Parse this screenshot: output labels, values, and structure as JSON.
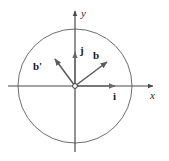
{
  "figure": {
    "name": "unit-circle-basis-vectors",
    "background_color": "#ffffff",
    "stroke_color": "#595959",
    "axis_color": "#4a4a4a",
    "label_color": "#1a1a1a",
    "circle": {
      "center_x": 75,
      "center_y": 86,
      "radius": 57,
      "stroke_color": "#6e6e6e"
    },
    "origin": {
      "x": 75,
      "y": 86,
      "marker": "open-circle"
    },
    "axes": {
      "x": {
        "label": "x",
        "start_x": 8,
        "end_x": 155,
        "y": 86,
        "arrow": "right"
      },
      "y": {
        "label": "y",
        "x": 75,
        "start_y": 152,
        "end_y": 9,
        "arrow": "up"
      }
    },
    "vectors": [
      {
        "label": "i",
        "name": "vector-i",
        "from_x": 75,
        "from_y": 86,
        "to_x": 118,
        "to_y": 86,
        "label_x": 113,
        "label_y": 100,
        "color": "#6b6b6b"
      },
      {
        "label": "j",
        "name": "vector-j",
        "from_x": 75,
        "from_y": 86,
        "to_x": 75,
        "to_y": 49,
        "label_x": 80,
        "label_y": 53,
        "color": "#6b6b6b"
      },
      {
        "label": "b",
        "name": "vector-b",
        "from_x": 75,
        "from_y": 86,
        "to_x": 110,
        "to_y": 60,
        "label_x": 95,
        "label_y": 58,
        "color": "#5a5a5a"
      },
      {
        "label": "b'",
        "name": "vector-b-prime",
        "from_x": 75,
        "from_y": 86,
        "to_x": 53,
        "to_y": 56,
        "label_x": 36,
        "label_y": 69,
        "color": "#5a5a5a"
      }
    ]
  }
}
